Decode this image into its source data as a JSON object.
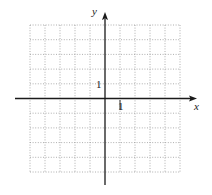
{
  "diagram": {
    "type": "coordinate-grid",
    "x_axis": {
      "label": "x",
      "unit_tick_label": "1",
      "range_cells": [
        -5,
        5
      ]
    },
    "y_axis": {
      "label": "y",
      "unit_tick_label": "1",
      "range_cells": [
        -5,
        5
      ]
    },
    "grid": {
      "columns": 10,
      "rows": 10,
      "style": "dotted"
    },
    "colors": {
      "axis": "#1a1a1a",
      "grid": "#9a9a9a",
      "background": "#ffffff",
      "text": "#222222"
    }
  }
}
